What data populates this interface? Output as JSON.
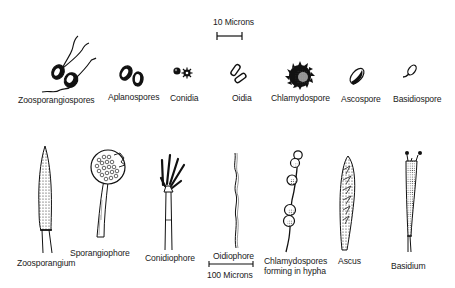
{
  "diagram": {
    "scale_bars": {
      "spores": {
        "label": "10 Microns"
      },
      "structures": {
        "label": "100 Microns"
      }
    },
    "spores": [
      {
        "name": "Zoosporangiospores"
      },
      {
        "name": "Aplanospores"
      },
      {
        "name": "Conidia"
      },
      {
        "name": "Oidia"
      },
      {
        "name": "Chlamydospore"
      },
      {
        "name": "Ascospore"
      },
      {
        "name": "Basidiospore"
      }
    ],
    "structures": [
      {
        "name": "Zoosporangium"
      },
      {
        "name": "Sporangiophore"
      },
      {
        "name": "Conidiophore"
      },
      {
        "name": "Oidiophore"
      },
      {
        "name": "Chlamydospores",
        "name_line2": "forming in hypha"
      },
      {
        "name": "Ascus"
      },
      {
        "name": "Basidium"
      }
    ]
  }
}
